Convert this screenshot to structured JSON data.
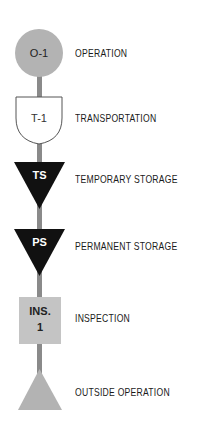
{
  "colors": {
    "background": "#ffffff",
    "gray_fill": "#b3b3b3",
    "square_fill": "#c4c4c4",
    "black_fill": "#111111",
    "white_fill": "#ffffff",
    "connector": "#8a8a8a",
    "text": "#1a1a1a"
  },
  "symbols": [
    {
      "id": "operation",
      "shape": "circle",
      "code": "O-1",
      "label": "OPERATION"
    },
    {
      "id": "transportation",
      "shape": "shield",
      "code": "T-1",
      "label": "TRANSPORTATION"
    },
    {
      "id": "temporary-storage",
      "shape": "inverted-triangle",
      "code": "TS",
      "label": "TEMPORARY STORAGE"
    },
    {
      "id": "permanent-storage",
      "shape": "inverted-triangle",
      "code": "PS",
      "label": "PERMANENT STORAGE"
    },
    {
      "id": "inspection",
      "shape": "square",
      "code_line1": "INS.",
      "code_line2": "1",
      "label": "INSPECTION"
    },
    {
      "id": "outside-operation",
      "shape": "triangle",
      "code": "",
      "label": "OUTSIDE OPERATION"
    }
  ]
}
